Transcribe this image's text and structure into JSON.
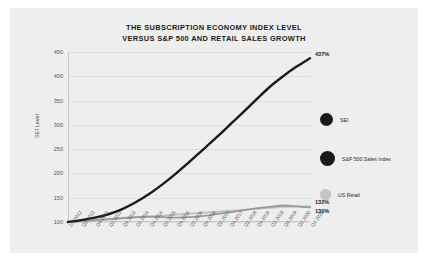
{
  "chart_data": {
    "type": "line",
    "title": "THE SUBSCRIPTION ECONOMY INDEX LEVEL\nVERSUS S&P 500 AND RETAIL SALES GROWTH",
    "xlabel": "",
    "ylabel": "SEI Level",
    "ylim": [
      100,
      450
    ],
    "yticks": [
      100,
      150,
      200,
      250,
      300,
      350,
      400,
      450
    ],
    "grid": true,
    "legend_position": "right",
    "x": [
      "1/1/2012",
      "Q2 2012",
      "Q4 2012",
      "Q2 2013",
      "Q4 2013",
      "Q2 2014",
      "Q4 2014",
      "Q2 2015",
      "Q4 2015",
      "Q2 2016",
      "Q4 2016",
      "Q2 2017",
      "Q4 2017",
      "Q2 2018",
      "Q4 2018",
      "Q2 2019",
      "Q4 2019",
      "Q2 2020",
      "Q4 2020"
    ],
    "series": [
      {
        "name": "SEI",
        "color": "#1a1a1a",
        "end_label": "437%",
        "values": [
          100,
          104,
          109,
          116,
          126,
          140,
          157,
          177,
          199,
          223,
          248,
          273,
          299,
          325,
          352,
          378,
          400,
          420,
          437
        ]
      },
      {
        "name": "S&P 500 Sales Index",
        "color": "#9a9a9a",
        "end_label": "130%",
        "values": [
          100,
          102,
          104,
          106,
          108,
          110,
          111,
          110,
          109,
          110,
          112,
          116,
          120,
          124,
          128,
          131,
          134,
          132,
          130
        ]
      },
      {
        "name": "US Retail",
        "color": "#bfbfbf",
        "end_label": "132%",
        "values": [
          100,
          101,
          103,
          105,
          107,
          109,
          111,
          113,
          115,
          117,
          119,
          121,
          123,
          125,
          127,
          129,
          131,
          132,
          132
        ]
      }
    ]
  },
  "legend": {
    "items": [
      {
        "label": "SEI",
        "color": "#1a1a1a",
        "size": 13
      },
      {
        "label": "S&P 500 Sales Index",
        "color": "#1a1a1a",
        "size": 15
      },
      {
        "label": "US Retail",
        "color": "#c4c4c4",
        "size": 11
      }
    ]
  }
}
